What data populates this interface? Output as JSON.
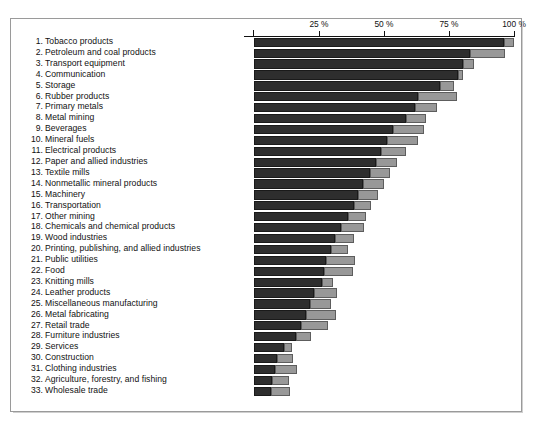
{
  "chart_data": {
    "type": "bar",
    "orientation": "horizontal",
    "title": "",
    "xlabel": "",
    "ylabel": "",
    "xlim": [
      0,
      100
    ],
    "grid": false,
    "legend": null,
    "stacked": true,
    "axis_ticks": [
      {
        "value": 25,
        "label": "25 %"
      },
      {
        "value": 50,
        "label": "50 %"
      },
      {
        "value": 75,
        "label": "75 %"
      },
      {
        "value": 100,
        "label": "100 %"
      }
    ],
    "series": [
      {
        "name": "dark-segment",
        "color": "#2e2e2e"
      },
      {
        "name": "light-segment",
        "color": "#989898"
      }
    ],
    "categories": [
      "1. Tobacco products",
      "2. Petroleum and coal products",
      "3. Transport equipment",
      "4. Communication",
      "5. Storage",
      "6. Rubber products",
      "7. Primary metals",
      "8. Metal mining",
      "9. Beverages",
      "10. Mineral fuels",
      "11. Electrical products",
      "12. Paper and allied industries",
      "13. Textile mills",
      "14. Nonmetallic mineral products",
      "15. Machinery",
      "16. Transportation",
      "17. Other mining",
      "18. Chemicals and chemical products",
      "19. Wood industries",
      "20. Printing, publishing, and allied industries",
      "21. Public utilities",
      "22. Food",
      "23. Knitting mills",
      "24. Leather products",
      "25. Miscellaneous  manufacturing",
      "26. Metal fabricating",
      "27. Retail trade",
      "28. Furniture industries",
      "29. Services",
      "30. Construction",
      "31. Clothing industries",
      "32. Agriculture, forestry, and fishing",
      "33. Wholesale trade"
    ],
    "rows": [
      {
        "label": "1. Tobacco products",
        "dark": 96.0,
        "light": 100.0
      },
      {
        "label": "2. Petroleum and coal products",
        "dark": 83.0,
        "light": 96.5
      },
      {
        "label": "3. Transport equipment",
        "dark": 80.5,
        "light": 84.5
      },
      {
        "label": "4. Communication",
        "dark": 78.5,
        "light": 80.5
      },
      {
        "label": "5. Storage",
        "dark": 71.5,
        "light": 77.0
      },
      {
        "label": "6. Rubber products",
        "dark": 63.0,
        "light": 78.0
      },
      {
        "label": "7. Primary metals",
        "dark": 62.0,
        "light": 70.5
      },
      {
        "label": "8. Metal mining",
        "dark": 58.5,
        "light": 66.0
      },
      {
        "label": "9. Beverages",
        "dark": 53.5,
        "light": 65.5
      },
      {
        "label": "10. Mineral fuels",
        "dark": 51.0,
        "light": 63.0
      },
      {
        "label": "11. Electrical products",
        "dark": 49.0,
        "light": 58.5
      },
      {
        "label": "12. Paper and allied industries",
        "dark": 47.0,
        "light": 55.0
      },
      {
        "label": "13. Textile mills",
        "dark": 44.5,
        "light": 52.5
      },
      {
        "label": "14. Nonmetallic mineral products",
        "dark": 42.0,
        "light": 50.0
      },
      {
        "label": "15. Machinery",
        "dark": 40.0,
        "light": 47.5
      },
      {
        "label": "16. Transportation",
        "dark": 38.5,
        "light": 45.0
      },
      {
        "label": "17. Other mining",
        "dark": 36.0,
        "light": 43.0
      },
      {
        "label": "18. Chemicals and chemical products",
        "dark": 33.5,
        "light": 42.5
      },
      {
        "label": "19. Wood industries",
        "dark": 31.0,
        "light": 38.5
      },
      {
        "label": "20. Printing, publishing, and allied industries",
        "dark": 29.5,
        "light": 36.0
      },
      {
        "label": "21. Public utilities",
        "dark": 27.5,
        "light": 39.0
      },
      {
        "label": "22. Food",
        "dark": 27.0,
        "light": 38.0
      },
      {
        "label": "23. Knitting mills",
        "dark": 26.0,
        "light": 30.5
      },
      {
        "label": "24. Leather products",
        "dark": 23.0,
        "light": 32.0
      },
      {
        "label": "25. Miscellaneous  manufacturing",
        "dark": 21.5,
        "light": 29.5
      },
      {
        "label": "26. Metal fabricating",
        "dark": 20.0,
        "light": 31.5
      },
      {
        "label": "27. Retail trade",
        "dark": 18.0,
        "light": 28.5
      },
      {
        "label": "28. Furniture industries",
        "dark": 16.0,
        "light": 22.0
      },
      {
        "label": "29. Services",
        "dark": 11.5,
        "light": 14.5
      },
      {
        "label": "30. Construction",
        "dark": 9.0,
        "light": 15.0
      },
      {
        "label": "31. Clothing industries",
        "dark": 8.0,
        "light": 16.5
      },
      {
        "label": "32. Agriculture, forestry, and fishing",
        "dark": 7.0,
        "light": 13.5
      },
      {
        "label": "33. Wholesale trade",
        "dark": 6.5,
        "light": 14.0
      }
    ]
  }
}
